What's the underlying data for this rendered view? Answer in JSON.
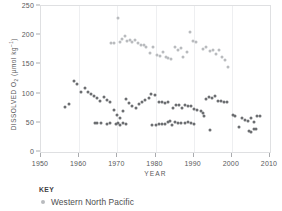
{
  "chart_data": {
    "type": "scatter",
    "title": "",
    "xlabel": "YEAR",
    "ylabel": "DISSOLVED O2 (umol kg-1)",
    "ylabel_parts": {
      "prefix": "DISSOLVED O",
      "subscript": "2",
      "unit_open": " (µmol kg",
      "superscript": "–1",
      "unit_close": ")"
    },
    "xlim": [
      1950,
      2010
    ],
    "ylim": [
      0,
      250
    ],
    "xticks": [
      1950,
      1960,
      1970,
      1980,
      1990,
      2000,
      2010
    ],
    "yticks": [
      0,
      50,
      100,
      150,
      200,
      250
    ],
    "grid": "vertical-light",
    "legend_position": "below-plot",
    "marker_colors": {
      "light": "#b9bbbe",
      "dark": "#6c6e71"
    },
    "series": [
      {
        "name": "Western North Pacific",
        "color": "#b9bbbe",
        "group": "upper-band",
        "points": [
          [
            1968.4,
            186
          ],
          [
            1969.2,
            186
          ],
          [
            1970.3,
            230
          ],
          [
            1970.6,
            188
          ],
          [
            1971.3,
            193
          ],
          [
            1972.0,
            198
          ],
          [
            1972.6,
            190
          ],
          [
            1973.2,
            192
          ],
          [
            1973.9,
            189
          ],
          [
            1974.6,
            191
          ],
          [
            1975.4,
            186
          ],
          [
            1976.2,
            183
          ],
          [
            1976.9,
            184
          ],
          [
            1977.6,
            179
          ],
          [
            1978.6,
            170
          ],
          [
            1979.4,
            179
          ],
          [
            1980.4,
            166
          ],
          [
            1981.2,
            164
          ],
          [
            1982.0,
            171
          ],
          [
            1982.7,
            163
          ],
          [
            1983.4,
            161
          ],
          [
            1984.1,
            160
          ],
          [
            1985.0,
            179
          ],
          [
            1985.8,
            175
          ],
          [
            1986.6,
            178
          ],
          [
            1987.3,
            162
          ],
          [
            1988.3,
            172
          ],
          [
            1989.1,
            206
          ],
          [
            1989.9,
            190
          ],
          [
            1990.7,
            189
          ],
          [
            1992.4,
            176
          ],
          [
            1993.2,
            180
          ],
          [
            1994.2,
            173
          ],
          [
            1995.0,
            175
          ],
          [
            1995.8,
            168
          ],
          [
            1996.6,
            174
          ],
          [
            1997.4,
            163
          ],
          [
            1998.2,
            157
          ],
          [
            1999.0,
            146
          ]
        ]
      },
      {
        "name": "Western North Pacific",
        "color": "#6c6e71",
        "group": "middle-band",
        "points": [
          [
            1956.3,
            77
          ],
          [
            1957.4,
            83
          ],
          [
            1958.6,
            121
          ],
          [
            1959.4,
            117
          ],
          [
            1960.6,
            103
          ],
          [
            1961.4,
            109
          ],
          [
            1962.2,
            103
          ],
          [
            1963.0,
            99
          ],
          [
            1963.8,
            96
          ],
          [
            1964.6,
            92
          ],
          [
            1965.4,
            88
          ],
          [
            1966.6,
            94
          ],
          [
            1967.4,
            89
          ],
          [
            1968.2,
            86
          ],
          [
            1969.0,
            72
          ],
          [
            1969.8,
            63
          ],
          [
            1970.6,
            59
          ],
          [
            1971.4,
            70
          ],
          [
            1972.2,
            91
          ],
          [
            1973.0,
            84
          ],
          [
            1973.8,
            79
          ],
          [
            1974.8,
            76
          ],
          [
            1975.6,
            82
          ],
          [
            1976.4,
            85
          ],
          [
            1977.2,
            89
          ],
          [
            1978.2,
            93
          ],
          [
            1978.9,
            99
          ],
          [
            1979.8,
            98
          ],
          [
            1981.0,
            85
          ],
          [
            1981.8,
            86
          ],
          [
            1982.6,
            84
          ],
          [
            1983.4,
            85
          ],
          [
            1984.6,
            75
          ],
          [
            1985.4,
            81
          ],
          [
            1986.2,
            80
          ],
          [
            1987.0,
            76
          ],
          [
            1987.8,
            81
          ],
          [
            1988.6,
            78
          ],
          [
            1989.4,
            79
          ],
          [
            1990.2,
            74
          ],
          [
            1991.0,
            72
          ],
          [
            1991.8,
            71
          ],
          [
            1992.4,
            66
          ],
          [
            1992.6,
            62
          ],
          [
            1993.2,
            91
          ],
          [
            1994.0,
            95
          ],
          [
            1994.8,
            93
          ],
          [
            1995.6,
            96
          ],
          [
            1996.4,
            88
          ],
          [
            1997.2,
            87
          ],
          [
            1998.0,
            86
          ],
          [
            1998.8,
            85
          ],
          [
            2000.2,
            63
          ],
          [
            2000.9,
            61
          ],
          [
            2001.8,
            43
          ],
          [
            2002.6,
            58
          ],
          [
            2003.4,
            55
          ],
          [
            2004.2,
            53
          ],
          [
            2005.0,
            58
          ],
          [
            2005.8,
            52
          ],
          [
            2006.6,
            62
          ],
          [
            2007.4,
            61
          ]
        ]
      },
      {
        "name": "Western North Pacific",
        "color": "#6c6e71",
        "group": "lower-band",
        "points": [
          [
            1964.2,
            50
          ],
          [
            1964.8,
            50
          ],
          [
            1965.6,
            49
          ],
          [
            1967.4,
            48
          ],
          [
            1968.2,
            49
          ],
          [
            1969.6,
            48
          ],
          [
            1970.2,
            50
          ],
          [
            1970.8,
            46
          ],
          [
            1971.6,
            50
          ],
          [
            1972.4,
            48
          ],
          [
            1979.2,
            47
          ],
          [
            1980.0,
            47
          ],
          [
            1980.8,
            48
          ],
          [
            1981.6,
            48
          ],
          [
            1982.4,
            48
          ],
          [
            1983.2,
            52
          ],
          [
            1983.8,
            53
          ],
          [
            1984.4,
            46
          ],
          [
            1985.2,
            52
          ],
          [
            1986.0,
            50
          ],
          [
            1986.8,
            49
          ],
          [
            1987.6,
            49
          ],
          [
            1988.4,
            51
          ],
          [
            1989.2,
            49
          ],
          [
            1990.0,
            48
          ],
          [
            1994.4,
            37
          ],
          [
            2004.4,
            36
          ],
          [
            2005.0,
            35
          ],
          [
            2005.8,
            39
          ],
          [
            2006.4,
            39
          ]
        ]
      }
    ]
  },
  "axes": {
    "x_title": "YEAR",
    "y_title_prefix": "DISSOLVED O",
    "y_title_sub": "2",
    "y_title_unit_open": " (µmol kg",
    "y_title_sup": "–1",
    "y_title_unit_close": ")"
  },
  "legend": {
    "title": "KEY",
    "entries": [
      {
        "label": "Western North Pacific",
        "color": "#b9bbbe"
      }
    ]
  }
}
